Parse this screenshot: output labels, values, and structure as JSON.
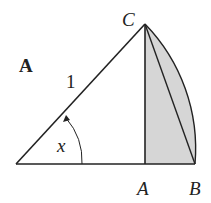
{
  "diagram": {
    "panel_label": "A",
    "hypotenuse_label": "1",
    "angle_label": "x",
    "vertex_labels": {
      "top": "C",
      "foot": "A",
      "end": "B"
    },
    "colors": {
      "stroke": "#222222",
      "shaded_region": "#d6d6d6",
      "background": "#ffffff"
    }
  }
}
